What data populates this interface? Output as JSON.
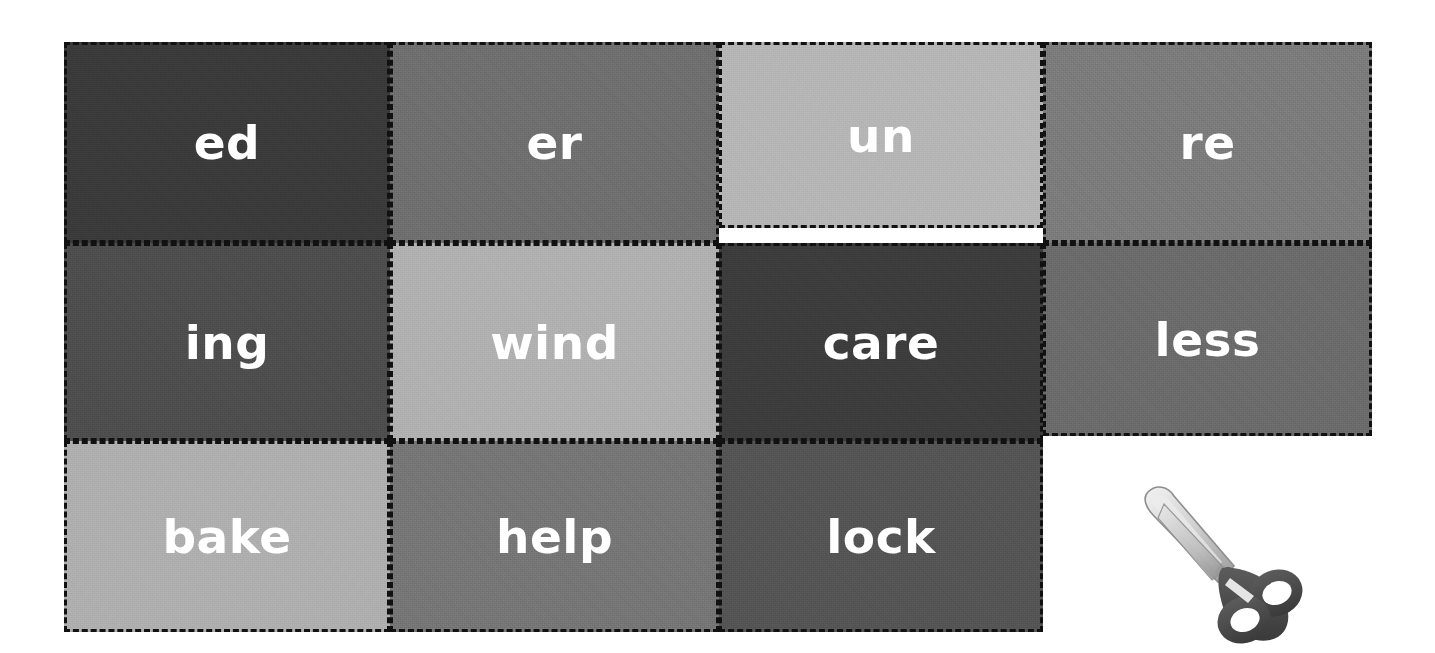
{
  "worksheet": {
    "title": "Word Building Cut-Out Cards",
    "background_color": "#ffffff",
    "border_style": "dashed",
    "border_color": "#111111",
    "label_color": "#ffffff",
    "columns": 4,
    "rows": 3,
    "cards": [
      {
        "label": "ed",
        "type": "suffix",
        "color": "#3a3a3a",
        "row": 1,
        "col": 1,
        "x": 64,
        "y": 42,
        "width": 326,
        "height": 201
      },
      {
        "label": "er",
        "type": "suffix",
        "color": "#6e6e6e",
        "row": 1,
        "col": 2,
        "x": 390,
        "y": 42,
        "width": 329,
        "height": 201
      },
      {
        "label": "un",
        "type": "prefix",
        "color": "#b5b5b5",
        "row": 1,
        "col": 3,
        "x": 719,
        "y": 42,
        "width": 324,
        "height": 186
      },
      {
        "label": "re",
        "type": "prefix",
        "color": "#7b7b7b",
        "row": 1,
        "col": 4,
        "x": 1043,
        "y": 42,
        "width": 329,
        "height": 201
      },
      {
        "label": "ing",
        "type": "suffix",
        "color": "#4d4d4d",
        "row": 2,
        "col": 1,
        "x": 64,
        "y": 243,
        "width": 326,
        "height": 198
      },
      {
        "label": "wind",
        "type": "root",
        "color": "#b0b0b0",
        "row": 2,
        "col": 2,
        "x": 390,
        "y": 243,
        "width": 329,
        "height": 198
      },
      {
        "label": "care",
        "type": "root",
        "color": "#3c3c3c",
        "row": 2,
        "col": 3,
        "x": 719,
        "y": 243,
        "width": 324,
        "height": 198
      },
      {
        "label": "less",
        "type": "suffix",
        "color": "#6a6a6a",
        "row": 2,
        "col": 4,
        "x": 1043,
        "y": 243,
        "width": 329,
        "height": 193
      },
      {
        "label": "bake",
        "type": "root",
        "color": "#aeaeae",
        "row": 3,
        "col": 1,
        "x": 64,
        "y": 441,
        "width": 326,
        "height": 191
      },
      {
        "label": "help",
        "type": "root",
        "color": "#757575",
        "row": 3,
        "col": 2,
        "x": 390,
        "y": 441,
        "width": 329,
        "height": 191
      },
      {
        "label": "lock",
        "type": "root",
        "color": "#545454",
        "row": 3,
        "col": 3,
        "x": 719,
        "y": 441,
        "width": 324,
        "height": 191
      }
    ]
  },
  "scissors": {
    "icon_name": "scissors-icon",
    "x": 1130,
    "y": 470,
    "width": 190,
    "height": 175,
    "handle_color": "#4a4a4a",
    "blade_color": "#d8d8d8",
    "blade_edge_color": "#8e8e8e"
  }
}
